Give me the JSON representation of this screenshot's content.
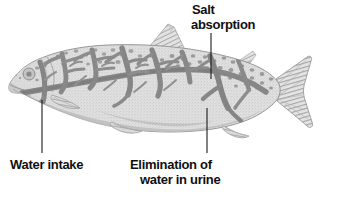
{
  "figure": {
    "kind": "biology-diagram",
    "background_color": "#ffffff",
    "labels": [
      {
        "name": "salt-absorption",
        "line1": "Salt",
        "line2": "absorption",
        "pointer": {
          "x1": 211,
          "y1": 33,
          "x2": 211,
          "y2": 78
        }
      },
      {
        "name": "water-intake",
        "line1": "Water intake",
        "line2": "",
        "pointer": {
          "x1": 42,
          "y1": 100,
          "x2": 42,
          "y2": 152
        }
      },
      {
        "name": "elimination-of-water-in-urine",
        "line1": "Elimination of",
        "line2": "water in urine",
        "pointer": {
          "x1": 207,
          "y1": 108,
          "x2": 207,
          "y2": 152
        }
      }
    ],
    "colors": {
      "text": "#100f0f",
      "pointer_line": "#1a1a1a",
      "body_light": "#dcdcdc",
      "body_mid": "#c9c9c9",
      "body_shadow": "#b4b4b4",
      "vessel_dark": "#8a8a8a",
      "outline": "#9a9a9a",
      "fin_hatch": "#a8a8a8",
      "spot": "#9e9e9e"
    },
    "fish": {
      "spots_upper_count": 46,
      "head_spots_count": 12,
      "dorsal_fin": "triangular-hatched",
      "caudal_fin": "forked-hatched",
      "vessel_pattern": "dendritic-branching-dark-gray"
    }
  }
}
